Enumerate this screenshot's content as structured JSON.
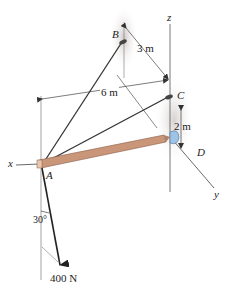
{
  "figure": {
    "points": {
      "A": "A",
      "B": "B",
      "C": "C",
      "D": "D"
    },
    "axes": {
      "x": "x",
      "y": "y",
      "z": "z"
    },
    "dimensions": {
      "AB_horizontal": "6 m",
      "B_to_C": "3 m",
      "C_to_D": "2 m"
    },
    "force": {
      "magnitude": "400 N",
      "angle": "30°"
    },
    "colors": {
      "rod": "#c9967a",
      "rod_edge": "#8a5a44",
      "socket": "#9ec3e6",
      "shadow": "#d9d4d2",
      "line": "#333333"
    }
  }
}
